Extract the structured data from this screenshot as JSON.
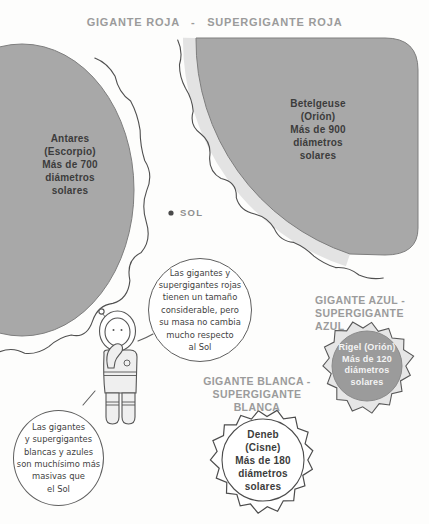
{
  "title": "GIGANTE ROJA   -   SUPERGIGANTE ROJA",
  "stars": {
    "antares": {
      "label": "Antares\n(Escorpio)\nMás de 700\ndiámetros\nsolares",
      "diameters": 700
    },
    "betelgeuse": {
      "label": "Betelgeuse\n(Orión)\nMás de 900\ndiámetros\nsolares",
      "diameters": 900
    },
    "rigel": {
      "label": "Rigel (Orión)\nMás de 120\ndiámetros\nsolares",
      "diameters": 120
    },
    "deneb": {
      "label": "Deneb\n(Cisne)\nMás de 180\ndiámetros\nsolares",
      "diameters": 180
    }
  },
  "sun": {
    "label": "SOL"
  },
  "headings": {
    "blue": "GIGANTE AZUL -\nSUPERGIGANTE AZUL",
    "white": "GIGANTE BLANCA -\nSUPERGIGANTE BLANCA"
  },
  "speech_bubbles": {
    "red_giants": "Las gigantes y\nsupergigantes rojas\ntienen un tamaño\nconsiderable, pero\nsu masa no cambia\nmucho respecto\nal Sol",
    "white_blue_giants": "Las gigantes\ny supergigantes\nblancas y azules\nson muchísimo más\nmasivas que\nel Sol"
  },
  "palette": {
    "bg": "#fdfdfc",
    "star-gray": "#a8a8a8",
    "band-light": "#e3e3e3",
    "corona-line": "#4f4f4f",
    "heading-gray": "#9b9b9b",
    "text-dark": "#3c3c3c",
    "rigel-gray": "#9b9b9b"
  }
}
